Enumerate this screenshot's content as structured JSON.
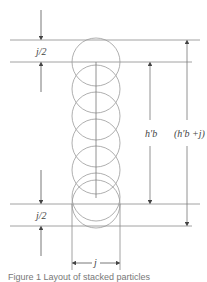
{
  "figure": {
    "labels": {
      "top_gap": "j/2",
      "bottom_gap": "j/2",
      "inner_height": "h′b",
      "outer_height": "(h′b +j)",
      "width": "j"
    },
    "caption": "Figure 1 Layout of stacked particles"
  },
  "colors": {
    "line": "#8a8a8a",
    "circle": "#9a9a9a",
    "arrow": "#444444",
    "text": "#444444"
  }
}
